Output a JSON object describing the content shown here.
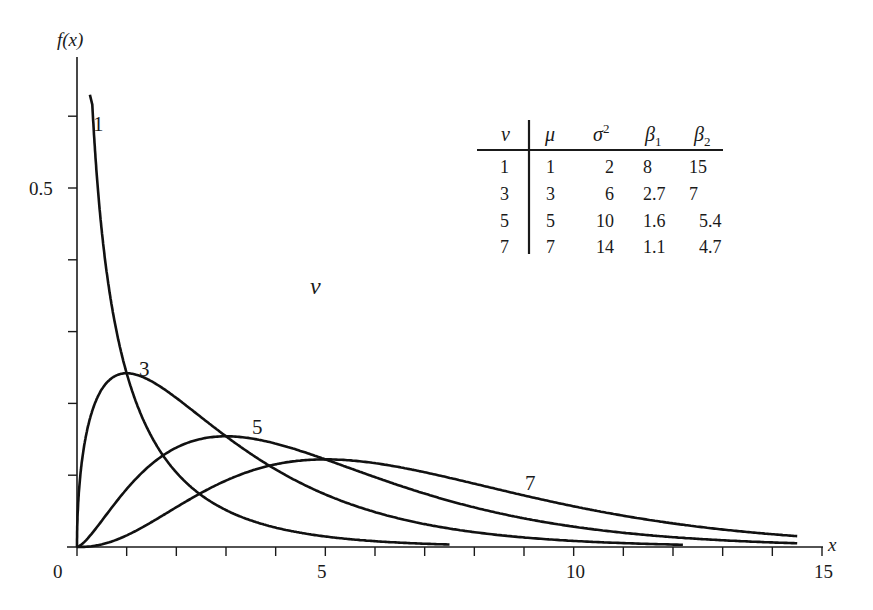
{
  "chart_data": {
    "type": "line",
    "title": "",
    "xlabel": "x",
    "ylabel": "f(x)",
    "xlim": [
      0,
      15
    ],
    "ylim": [
      0,
      0.65
    ],
    "grid": false,
    "x_tick_labels": [
      {
        "value": 0,
        "label": "0"
      },
      {
        "value": 5,
        "label": "5"
      },
      {
        "value": 10,
        "label": "10"
      },
      {
        "value": 15,
        "label": "15"
      }
    ],
    "x_minor_ticks": [
      0,
      1,
      2,
      3,
      4,
      5,
      6,
      7,
      8,
      9,
      10,
      11,
      12,
      13,
      14,
      15
    ],
    "y_tick_labels": [
      {
        "value": 0.5,
        "label": "0.5"
      }
    ],
    "y_minor_ticks": [
      0.1,
      0.2,
      0.3,
      0.4,
      0.5,
      0.6
    ],
    "parameter_symbol": "ν",
    "series": [
      {
        "name": "1",
        "nu": 1,
        "x_start": 0.22,
        "x_end": 7.5,
        "label_x": 0.55,
        "label_y": 0.585,
        "points": [
          [
            0.25,
            0.7
          ],
          [
            0.5,
            0.44
          ],
          [
            1,
            0.242
          ],
          [
            2,
            0.104
          ],
          [
            3,
            0.051
          ],
          [
            4,
            0.027
          ],
          [
            5,
            0.015
          ],
          [
            6,
            0.008
          ],
          [
            7.5,
            0.003
          ]
        ]
      },
      {
        "name": "3",
        "nu": 3,
        "x_start": 0.0,
        "x_end": 12.2,
        "label_x": 1.8,
        "label_y": 0.245,
        "points": [
          [
            0,
            0
          ],
          [
            0.5,
            0.176
          ],
          [
            1,
            0.242
          ],
          [
            2,
            0.208
          ],
          [
            3,
            0.154
          ],
          [
            4,
            0.108
          ],
          [
            5,
            0.073
          ],
          [
            6,
            0.048
          ],
          [
            8,
            0.02
          ],
          [
            10,
            0.008
          ],
          [
            12.2,
            0.003
          ]
        ]
      },
      {
        "name": "5",
        "nu": 5,
        "x_start": 0.0,
        "x_end": 14.5,
        "label_x": 3.75,
        "label_y": 0.165,
        "points": [
          [
            0,
            0
          ],
          [
            1,
            0.081
          ],
          [
            2,
            0.138
          ],
          [
            3,
            0.154
          ],
          [
            4,
            0.144
          ],
          [
            5,
            0.122
          ],
          [
            6,
            0.096
          ],
          [
            8,
            0.054
          ],
          [
            10,
            0.028
          ],
          [
            12,
            0.014
          ],
          [
            14.5,
            0.005
          ]
        ]
      },
      {
        "name": "7",
        "nu": 7,
        "x_start": 0.0,
        "x_end": 14.5,
        "label_x": 9.5,
        "label_y": 0.083,
        "points": [
          [
            0,
            0
          ],
          [
            1,
            0.019
          ],
          [
            2,
            0.055
          ],
          [
            3,
            0.089
          ],
          [
            4,
            0.108
          ],
          [
            5,
            0.115
          ],
          [
            6,
            0.111
          ],
          [
            8,
            0.087
          ],
          [
            10,
            0.057
          ],
          [
            12,
            0.034
          ],
          [
            14.5,
            0.016
          ]
        ]
      }
    ],
    "annotations": [
      {
        "text": "ν",
        "x": 4.8,
        "y": 0.36
      }
    ],
    "table": {
      "columns": [
        "ν",
        "μ",
        "σ²",
        "β₁",
        "β₂"
      ],
      "rows": [
        [
          "1",
          "1",
          "2",
          "8",
          "15"
        ],
        [
          "3",
          "3",
          "6",
          "2.7",
          "7"
        ],
        [
          "5",
          "5",
          "10",
          "1.6",
          "5.4"
        ],
        [
          "7",
          "7",
          "14",
          "1.1",
          "4.7"
        ]
      ]
    }
  },
  "axes": {
    "y_title": "f(x)",
    "x_title": "x",
    "y_label_05": "0.5",
    "x_labels": [
      "0",
      "5",
      "10",
      "15"
    ]
  },
  "legend_table": {
    "headers": {
      "nu": "ν",
      "mu": "μ",
      "sigma": "σ",
      "sigma_sup": "2",
      "beta1": "β",
      "beta1_sub": "1",
      "beta2": "β",
      "beta2_sub": "2"
    },
    "rows": [
      {
        "nu": "1",
        "mu": "1",
        "var": "2",
        "b1": "8",
        "b2": "15"
      },
      {
        "nu": "3",
        "mu": "3",
        "var": "6",
        "b1": "2.7",
        "b2": "7"
      },
      {
        "nu": "5",
        "mu": "5",
        "var": "10",
        "b1": "1.6",
        "b2": "5.4"
      },
      {
        "nu": "7",
        "mu": "7",
        "var": "14",
        "b1": "1.1",
        "b2": "4.7"
      }
    ]
  },
  "curve_labels": {
    "c1": "1",
    "c3": "3",
    "c5": "5",
    "c7": "7",
    "nu": "ν"
  },
  "colors": {
    "ink": "#111111",
    "background": "#ffffff"
  }
}
